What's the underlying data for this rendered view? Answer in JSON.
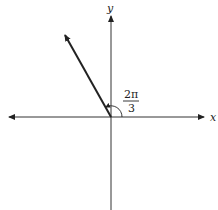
{
  "diagram": {
    "type": "angle-in-standard-position",
    "axes": {
      "x_label": "x",
      "y_label": "y"
    },
    "angle": {
      "numerator": "2π",
      "denominator": "3",
      "value_radians": 2.0944
    },
    "colors": {
      "ink": "#222222",
      "background": "#ffffff"
    }
  }
}
